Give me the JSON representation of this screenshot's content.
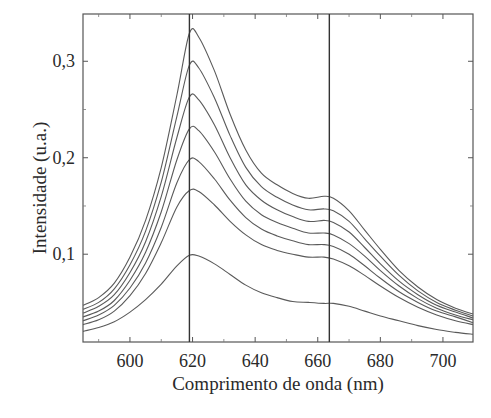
{
  "chart_data": {
    "type": "line",
    "title": "",
    "xlabel": "Comprimento de onda (nm)",
    "ylabel": "Intensidade (u.a.)",
    "xlim": [
      585,
      709.6
    ],
    "ylim": [
      0.009,
      0.349
    ],
    "grid": false,
    "legend": null,
    "x_ticks": [
      600,
      620,
      640,
      660,
      680,
      700
    ],
    "x_tick_labels": [
      "600",
      "620",
      "640",
      "660",
      "680",
      "700"
    ],
    "y_ticks": [
      0.1,
      0.2,
      0.3
    ],
    "y_tick_labels": [
      "0,1",
      "0,2",
      "0,3"
    ],
    "y_minor_ticks": [
      0.15,
      0.25
    ],
    "vertical_lines": [
      619,
      663.7
    ],
    "x": [
      585,
      590,
      595,
      600,
      605,
      610,
      615,
      619,
      622,
      627,
      632,
      637,
      642,
      647,
      652,
      657,
      662,
      665,
      670,
      675,
      680,
      686,
      692,
      698,
      704,
      709.6
    ],
    "series": [
      {
        "name": "curve-1",
        "values": [
          0.047,
          0.055,
          0.07,
          0.097,
          0.135,
          0.19,
          0.265,
          0.329,
          0.325,
          0.29,
          0.245,
          0.208,
          0.184,
          0.172,
          0.163,
          0.158,
          0.16,
          0.158,
          0.145,
          0.125,
          0.105,
          0.083,
          0.066,
          0.053,
          0.044,
          0.038
        ]
      },
      {
        "name": "curve-2",
        "values": [
          0.043,
          0.05,
          0.064,
          0.089,
          0.124,
          0.175,
          0.243,
          0.296,
          0.293,
          0.262,
          0.223,
          0.19,
          0.17,
          0.159,
          0.151,
          0.146,
          0.147,
          0.145,
          0.134,
          0.116,
          0.098,
          0.078,
          0.062,
          0.05,
          0.042,
          0.036
        ]
      },
      {
        "name": "curve-3",
        "values": [
          0.039,
          0.046,
          0.058,
          0.081,
          0.113,
          0.16,
          0.221,
          0.263,
          0.26,
          0.234,
          0.2,
          0.172,
          0.156,
          0.146,
          0.139,
          0.134,
          0.135,
          0.133,
          0.123,
          0.107,
          0.09,
          0.072,
          0.058,
          0.047,
          0.04,
          0.034
        ]
      },
      {
        "name": "curve-4",
        "values": [
          0.035,
          0.041,
          0.052,
          0.073,
          0.102,
          0.144,
          0.198,
          0.23,
          0.228,
          0.206,
          0.178,
          0.155,
          0.141,
          0.133,
          0.127,
          0.122,
          0.122,
          0.12,
          0.111,
          0.098,
          0.083,
          0.067,
          0.054,
          0.044,
          0.037,
          0.032
        ]
      },
      {
        "name": "curve-5",
        "values": [
          0.031,
          0.037,
          0.047,
          0.065,
          0.091,
          0.128,
          0.174,
          0.198,
          0.196,
          0.178,
          0.156,
          0.138,
          0.126,
          0.119,
          0.114,
          0.11,
          0.11,
          0.108,
          0.1,
          0.088,
          0.075,
          0.061,
          0.05,
          0.041,
          0.035,
          0.029
        ]
      },
      {
        "name": "curve-6",
        "values": [
          0.027,
          0.032,
          0.041,
          0.057,
          0.08,
          0.112,
          0.149,
          0.166,
          0.165,
          0.151,
          0.134,
          0.12,
          0.11,
          0.104,
          0.1,
          0.097,
          0.097,
          0.095,
          0.088,
          0.078,
          0.067,
          0.055,
          0.045,
          0.037,
          0.031,
          0.027
        ]
      },
      {
        "name": "curve-7",
        "values": [
          0.02,
          0.024,
          0.03,
          0.04,
          0.053,
          0.069,
          0.088,
          0.099,
          0.098,
          0.09,
          0.079,
          0.068,
          0.06,
          0.055,
          0.051,
          0.05,
          0.049,
          0.049,
          0.046,
          0.041,
          0.036,
          0.031,
          0.026,
          0.022,
          0.019,
          0.017
        ]
      }
    ]
  }
}
